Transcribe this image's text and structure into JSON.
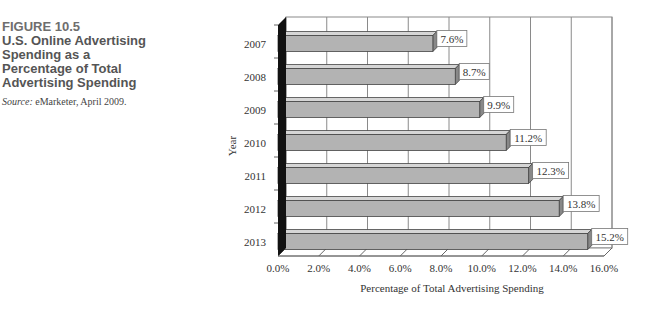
{
  "figure": {
    "number": "FIGURE 10.5",
    "title": "U.S. Online Advertising Spending as a Percentage of Total Advertising Spending",
    "source_label": "Source:",
    "source_text": " eMarketer, April 2009."
  },
  "chart_data": {
    "type": "bar",
    "orientation": "horizontal",
    "style": "3d",
    "title": "U.S. Online Advertising Spending as a Percentage of Total Advertising Spending",
    "categories": [
      "2007",
      "2008",
      "2009",
      "2010",
      "2011",
      "2012",
      "2013"
    ],
    "values": [
      7.6,
      8.7,
      9.9,
      11.2,
      12.3,
      13.8,
      15.2
    ],
    "value_labels": [
      "7.6%",
      "8.7%",
      "9.9%",
      "11.2%",
      "12.3%",
      "13.8%",
      "15.2%"
    ],
    "xlabel": "Percentage of Total Advertising Spending",
    "ylabel": "Year",
    "xlim": [
      0,
      16
    ],
    "x_ticks": [
      "0.0%",
      "2.0%",
      "4.0%",
      "6.0%",
      "8.0%",
      "10.0%",
      "12.0%",
      "14.0%",
      "16.0%"
    ],
    "grid": true,
    "legend": "none",
    "colors": {
      "bar": "#b3b3b3",
      "bar_top": "#d6d6d6",
      "wall": "#111111",
      "grid": "#8a8a8a"
    }
  }
}
